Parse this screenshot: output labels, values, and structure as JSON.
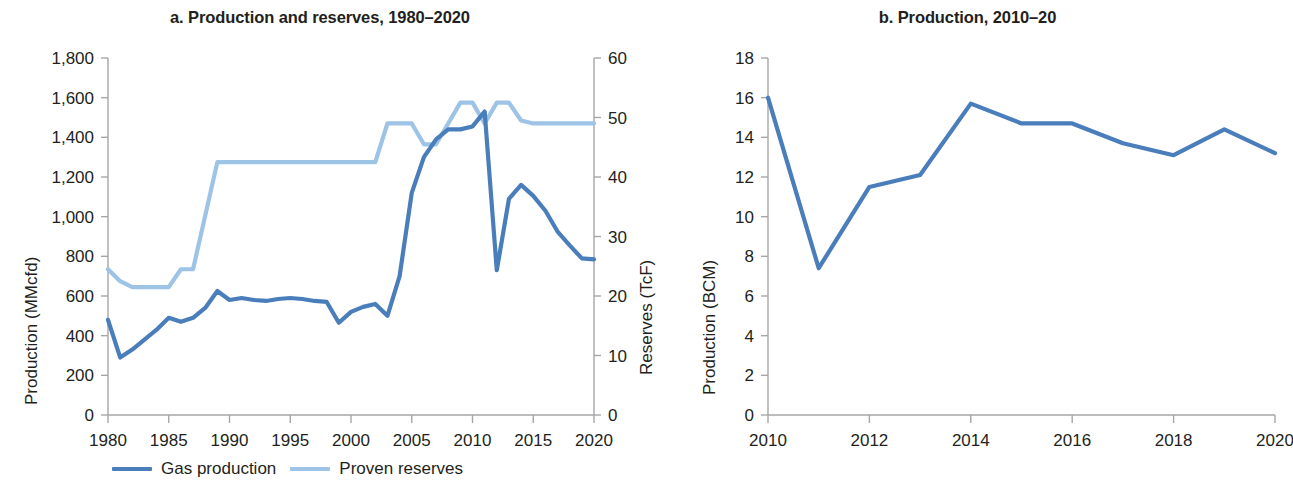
{
  "figure": {
    "panels": [
      {
        "id": "a",
        "title": "a. Production and reserves, 1980–2020",
        "y_left_label": "Production (MMcfd)",
        "y_right_label": "Reserves (TcF)",
        "x_label": ""
      },
      {
        "id": "b",
        "title": "b. Production, 2010–20",
        "y_left_label": "Production (BCM)",
        "x_label": ""
      }
    ],
    "legend": {
      "items": [
        {
          "label": "Gas production",
          "color": "#4a7ebb"
        },
        {
          "label": "Proven reserves",
          "color": "#9dc3e6"
        }
      ]
    },
    "colors": {
      "gas_production": "#4a7ebb",
      "proven_reserves": "#9dc3e6",
      "axis": "#a6a6a6",
      "text": "#231f20"
    }
  },
  "chart_data": [
    {
      "type": "line",
      "title": "a. Production and reserves, 1980–2020",
      "xlabel": "",
      "ylabel": "Production (MMcfd)",
      "y2label": "Reserves (TcF)",
      "xlim": [
        1980,
        2020
      ],
      "ylim": [
        0,
        1800
      ],
      "y2lim": [
        0,
        60
      ],
      "grid": false,
      "legend_position": "bottom",
      "xticks": [
        1980,
        1985,
        1990,
        1995,
        2000,
        2005,
        2010,
        2015,
        2020
      ],
      "yticks": [
        0,
        200,
        400,
        600,
        800,
        1000,
        1200,
        1400,
        1600,
        1800
      ],
      "ytick_labels": [
        "0",
        "200",
        "400",
        "600",
        "800",
        "1,000",
        "1,200",
        "1,400",
        "1,600",
        "1,800"
      ],
      "y2ticks": [
        0,
        10,
        20,
        30,
        40,
        50,
        60
      ],
      "y2tick_labels": [
        "0",
        "10",
        "20",
        "30",
        "40",
        "50",
        "60"
      ],
      "x": [
        1980,
        1981,
        1982,
        1983,
        1984,
        1985,
        1986,
        1987,
        1988,
        1989,
        1990,
        1991,
        1992,
        1993,
        1994,
        1995,
        1996,
        1997,
        1998,
        1999,
        2000,
        2001,
        2002,
        2003,
        2004,
        2005,
        2006,
        2007,
        2008,
        2009,
        2010,
        2011,
        2012,
        2013,
        2014,
        2015,
        2016,
        2017,
        2018,
        2019,
        2020
      ],
      "series": [
        {
          "name": "Gas production",
          "axis": "left",
          "units": "MMcfd",
          "color": "#4a7ebb",
          "values": [
            480,
            290,
            330,
            380,
            430,
            490,
            470,
            490,
            540,
            625,
            580,
            590,
            580,
            575,
            585,
            590,
            585,
            575,
            570,
            465,
            520,
            545,
            560,
            500,
            700,
            1120,
            1300,
            1390,
            1440,
            1440,
            1455,
            1530,
            730,
            1090,
            1160,
            1105,
            1030,
            925,
            855,
            790,
            785
          ]
        },
        {
          "name": "Proven reserves",
          "axis": "right",
          "units": "TcF",
          "color": "#9dc3e6",
          "values": [
            24.5,
            22.5,
            21.5,
            21.5,
            21.5,
            21.5,
            24.5,
            24.5,
            33.5,
            42.5,
            42.5,
            42.5,
            42.5,
            42.5,
            42.5,
            42.5,
            42.5,
            42.5,
            42.5,
            42.5,
            42.5,
            42.5,
            42.5,
            49.0,
            49.0,
            49.0,
            45.5,
            45.5,
            49.0,
            52.5,
            52.5,
            49.0,
            52.5,
            52.5,
            49.5,
            49.0,
            49.0,
            49.0,
            49.0,
            49.0,
            49.0
          ]
        }
      ]
    },
    {
      "type": "line",
      "title": "b. Production, 2010–20",
      "xlabel": "",
      "ylabel": "Production (BCM)",
      "xlim": [
        2010,
        2020
      ],
      "ylim": [
        0,
        18
      ],
      "grid": false,
      "legend_position": "none",
      "xticks": [
        2010,
        2012,
        2014,
        2016,
        2018,
        2020
      ],
      "yticks": [
        0,
        2,
        4,
        6,
        8,
        10,
        12,
        14,
        16,
        18
      ],
      "ytick_labels": [
        "0",
        "2",
        "4",
        "6",
        "8",
        "10",
        "12",
        "14",
        "16",
        "18"
      ],
      "x": [
        2010,
        2011,
        2012,
        2013,
        2014,
        2015,
        2016,
        2017,
        2018,
        2019,
        2020
      ],
      "series": [
        {
          "name": "Production",
          "axis": "left",
          "units": "BCM",
          "color": "#4a7ebb",
          "values": [
            16.0,
            7.4,
            11.5,
            12.1,
            15.7,
            14.7,
            14.7,
            13.7,
            13.1,
            14.4,
            13.2
          ]
        }
      ]
    }
  ]
}
